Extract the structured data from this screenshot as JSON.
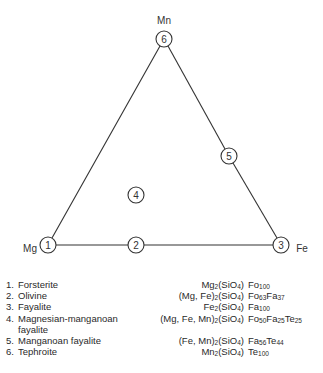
{
  "diagram": {
    "vertices": [
      {
        "label": "Mn",
        "position": "top"
      },
      {
        "label": "Mg",
        "position": "bottom-left"
      },
      {
        "label": "Fe",
        "position": "bottom-right"
      }
    ],
    "points": [
      {
        "id": "1",
        "x": 48,
        "y": 245
      },
      {
        "id": "2",
        "x": 136,
        "y": 245
      },
      {
        "id": "3",
        "x": 281,
        "y": 245
      },
      {
        "id": "4",
        "x": 136,
        "y": 195
      },
      {
        "id": "5",
        "x": 229,
        "y": 156
      },
      {
        "id": "6",
        "x": 164,
        "y": 39
      }
    ],
    "line_color": "#333333"
  },
  "legend": [
    {
      "num": "1.",
      "name": "Forsterite",
      "name2": "",
      "formula": [
        [
          "Mg",
          ""
        ],
        [
          "",
          "2"
        ],
        [
          "(SiO",
          ""
        ],
        [
          "",
          "4"
        ],
        [
          ")",
          ""
        ]
      ],
      "composition": [
        [
          "Fo",
          ""
        ],
        [
          "",
          "100"
        ]
      ]
    },
    {
      "num": "2.",
      "name": "Olivine",
      "name2": "",
      "formula": [
        [
          "(Mg, Fe)",
          ""
        ],
        [
          "",
          "2"
        ],
        [
          "(SiO",
          ""
        ],
        [
          "",
          "4"
        ],
        [
          ")",
          ""
        ]
      ],
      "composition": [
        [
          "Fo",
          ""
        ],
        [
          "",
          "63"
        ],
        [
          "Fa",
          ""
        ],
        [
          "",
          "37"
        ]
      ]
    },
    {
      "num": "3.",
      "name": "Fayalite",
      "name2": "",
      "formula": [
        [
          "Fe",
          ""
        ],
        [
          "",
          "2"
        ],
        [
          "(SiO",
          ""
        ],
        [
          "",
          "4"
        ],
        [
          ")",
          ""
        ]
      ],
      "composition": [
        [
          "Fa",
          ""
        ],
        [
          "",
          "100"
        ]
      ]
    },
    {
      "num": "4.",
      "name": "Magnesian-manganoan",
      "name2": "fayalite",
      "formula": [
        [
          "(Mg, Fe, Mn)",
          ""
        ],
        [
          "",
          "2"
        ],
        [
          "(SiO",
          ""
        ],
        [
          "",
          "4"
        ],
        [
          ")",
          ""
        ]
      ],
      "composition": [
        [
          "Fo",
          ""
        ],
        [
          "",
          "50"
        ],
        [
          "Fa",
          ""
        ],
        [
          "",
          "25"
        ],
        [
          "Te",
          ""
        ],
        [
          "",
          "25"
        ]
      ]
    },
    {
      "num": "5.",
      "name": "Manganoan fayalite",
      "name2": "",
      "formula": [
        [
          "(Fe, Mn)",
          ""
        ],
        [
          "",
          "2"
        ],
        [
          "(SiO",
          ""
        ],
        [
          "",
          "4"
        ],
        [
          ")",
          ""
        ]
      ],
      "composition": [
        [
          "Fa",
          ""
        ],
        [
          "",
          "56"
        ],
        [
          "Te",
          ""
        ],
        [
          "",
          "44"
        ]
      ]
    },
    {
      "num": "6.",
      "name": "Tephroite",
      "name2": "",
      "formula": [
        [
          "Mn",
          ""
        ],
        [
          "",
          "2"
        ],
        [
          "(SiO",
          ""
        ],
        [
          "",
          "4"
        ],
        [
          ")",
          ""
        ]
      ],
      "composition": [
        [
          "Te",
          ""
        ],
        [
          "",
          "100"
        ]
      ]
    }
  ]
}
